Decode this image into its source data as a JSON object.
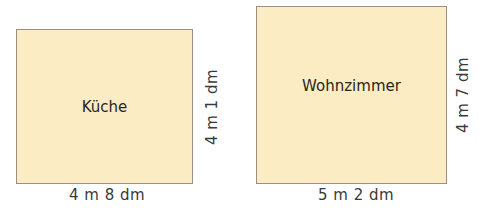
{
  "rooms": [
    {
      "name": "Küche",
      "width_label": "4 m 8 dm",
      "height_label": "4 m 1 dm",
      "fill_color": "#fcecc4"
    },
    {
      "name": "Wohnzimmer",
      "width_label": "5 m 2 dm",
      "height_label": "4 m 7 dm",
      "fill_color": "#fcecc4"
    }
  ]
}
